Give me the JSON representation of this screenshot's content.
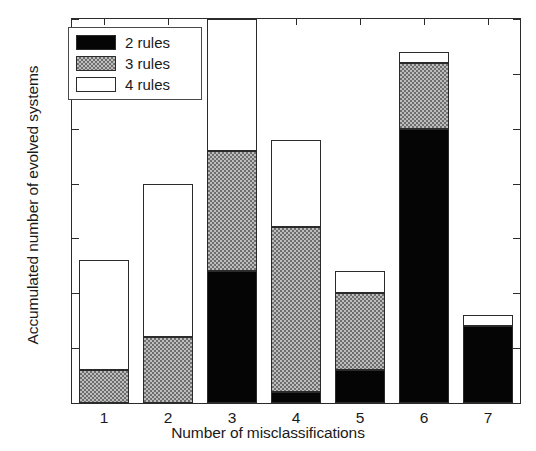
{
  "chart_data": {
    "type": "bar",
    "subtype": "stacked",
    "title": "",
    "xlabel": "Number of misclassifications",
    "ylabel": "Accumulated number of evolved systems",
    "categories": [
      "1",
      "2",
      "3",
      "4",
      "5",
      "6",
      "7"
    ],
    "xlim": [
      0.5,
      7.5
    ],
    "ylim": [
      0,
      35
    ],
    "yticks": [
      0,
      5,
      10,
      15,
      20,
      25,
      30,
      35
    ],
    "ytick_labels": [
      "0",
      "5",
      "10",
      "15",
      "20",
      "25",
      "30",
      "35"
    ],
    "xticks": [
      1,
      2,
      3,
      4,
      5,
      6,
      7
    ],
    "xtick_labels": [
      "1",
      "2",
      "3",
      "4",
      "5",
      "6",
      "7"
    ],
    "grid": false,
    "legend_position": "upper left",
    "series": [
      {
        "name": "2 rules",
        "color": "#050505",
        "pattern": "solid-black",
        "values": [
          0,
          0,
          12,
          1,
          3,
          25,
          7
        ]
      },
      {
        "name": "3 rules",
        "color": "#9c9c9c",
        "pattern": "checker-gray",
        "values": [
          3,
          6,
          11,
          15,
          7,
          6,
          0
        ]
      },
      {
        "name": "4 rules",
        "color": "#ffffff",
        "pattern": "solid-white",
        "values": [
          10,
          14,
          12,
          8,
          2,
          1,
          1
        ]
      }
    ],
    "cumulative_tops": {
      "2 rules": [
        0,
        0,
        12,
        1,
        3,
        25,
        7
      ],
      "3 rules": [
        3,
        6,
        23,
        16,
        10,
        31,
        7
      ],
      "4 rules": [
        13,
        20,
        35,
        24,
        12,
        32,
        8
      ]
    },
    "totals": [
      13,
      20,
      35,
      24,
      12,
      32,
      8
    ]
  },
  "legend": {
    "items": [
      {
        "label": "2 rules",
        "swatch": "black-swatch"
      },
      {
        "label": "3 rules",
        "swatch": "gray-swatch"
      },
      {
        "label": "4 rules",
        "swatch": "white-swatch"
      }
    ]
  },
  "colors": {
    "axis": "#2b2b2b",
    "black_series": "#050505",
    "gray_series": "#9c9c9c",
    "white_series": "#ffffff",
    "background": "#ffffff"
  }
}
